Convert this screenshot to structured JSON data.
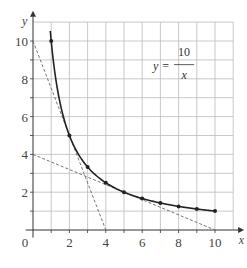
{
  "chart_data": {
    "type": "line",
    "title": "",
    "xlabel": "x",
    "ylabel": "y",
    "xlim": [
      0,
      11
    ],
    "ylim": [
      0,
      11
    ],
    "grid": true,
    "x_ticks": [
      "0",
      "2",
      "4",
      "6",
      "8",
      "10"
    ],
    "y_ticks": [
      "2",
      "4",
      "6",
      "8",
      "10"
    ],
    "annotation": {
      "lhs": "y =",
      "numerator": "10",
      "denominator": "x"
    },
    "series": [
      {
        "name": "y = 10/x",
        "style": "solid curve with point markers",
        "x": [
          1,
          2,
          3,
          4,
          5,
          6,
          7,
          8,
          9,
          10
        ],
        "y": [
          10,
          5,
          3.33,
          2.5,
          2,
          1.67,
          1.43,
          1.25,
          1.11,
          1
        ]
      },
      {
        "name": "tangent at x=2",
        "style": "dashed",
        "x": [
          0,
          4
        ],
        "y": [
          10,
          0
        ]
      },
      {
        "name": "tangent at x=5",
        "style": "dashed",
        "x": [
          0,
          10
        ],
        "y": [
          4,
          0
        ]
      }
    ]
  }
}
